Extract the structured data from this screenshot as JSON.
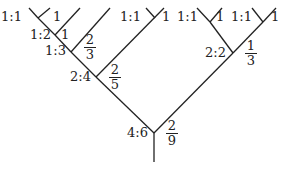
{
  "diagram": {
    "type": "tree",
    "line_color": "#222222",
    "nodes": [
      {
        "id": "root",
        "ratio": "4:6",
        "fraction": {
          "num": "2",
          "den": "9"
        }
      },
      {
        "id": "left",
        "ratio": "2:4",
        "fraction": {
          "num": "2",
          "den": "5"
        }
      },
      {
        "id": "left-left",
        "ratio": "1:3",
        "fraction": {
          "num": "2",
          "den": "3"
        }
      },
      {
        "id": "left-left-left",
        "ratio": "1:2",
        "value": "1"
      },
      {
        "id": "left-left-left-left",
        "ratio": "1:1",
        "value": "1"
      },
      {
        "id": "left-right",
        "ratio": "1:1",
        "value": "1"
      },
      {
        "id": "right",
        "ratio": "2:2",
        "fraction": {
          "num": "1",
          "den": "3"
        }
      },
      {
        "id": "right-left",
        "ratio": "1:1",
        "value": "1"
      },
      {
        "id": "right-right",
        "ratio": "1:1",
        "value": "1"
      }
    ]
  }
}
